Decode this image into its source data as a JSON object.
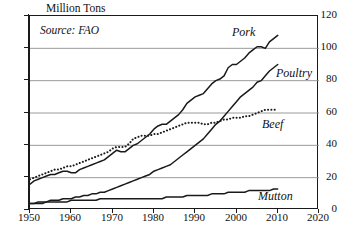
{
  "chart_data": {
    "type": "line",
    "title": "",
    "xlabel": "",
    "ylabel": "Million Tons",
    "ylabel_text": "Million Tons",
    "source_note": "Source: FAO",
    "xlim": [
      1950,
      2020
    ],
    "ylim": [
      0,
      120
    ],
    "xticks": [
      1950,
      1960,
      1970,
      1980,
      1990,
      2000,
      2010,
      2020
    ],
    "yticks": [
      0,
      20,
      40,
      60,
      80,
      100,
      120
    ],
    "grid": "horizontal",
    "legend_position": "inline-right-of-series",
    "x": [
      1950,
      1951,
      1952,
      1953,
      1954,
      1955,
      1956,
      1957,
      1958,
      1959,
      1960,
      1961,
      1962,
      1963,
      1964,
      1965,
      1966,
      1967,
      1968,
      1969,
      1970,
      1971,
      1972,
      1973,
      1974,
      1975,
      1976,
      1977,
      1978,
      1979,
      1980,
      1981,
      1982,
      1983,
      1984,
      1985,
      1986,
      1987,
      1988,
      1989,
      1990,
      1991,
      1992,
      1993,
      1994,
      1995,
      1996,
      1997,
      1998,
      1999,
      2000,
      2001,
      2002,
      2003,
      2004,
      2005,
      2006,
      2007,
      2008,
      2009,
      2010
    ],
    "series": [
      {
        "name": "Pork",
        "style": "solid",
        "label": "Pork",
        "end_value": 108,
        "values": [
          16,
          18,
          19,
          20,
          21,
          22,
          22,
          23,
          24,
          24,
          23,
          23,
          25,
          26,
          27,
          28,
          29,
          30,
          31,
          33,
          35,
          37,
          36,
          36,
          38,
          40,
          41,
          43,
          45,
          47,
          50,
          52,
          53,
          53,
          55,
          57,
          59,
          62,
          66,
          68,
          70,
          71,
          72,
          75,
          78,
          80,
          81,
          83,
          88,
          90,
          90,
          92,
          94,
          97,
          99,
          101,
          101,
          100,
          104,
          106,
          108
        ]
      },
      {
        "name": "Poultry",
        "style": "solid",
        "label": "Poultry",
        "end_value": 90,
        "values": [
          4,
          4,
          5,
          5,
          5,
          6,
          6,
          6,
          7,
          7,
          7,
          8,
          8,
          9,
          9,
          10,
          10,
          11,
          11,
          12,
          13,
          14,
          15,
          16,
          17,
          18,
          19,
          20,
          21,
          22,
          24,
          25,
          26,
          27,
          28,
          30,
          32,
          34,
          36,
          38,
          40,
          42,
          44,
          47,
          50,
          53,
          55,
          58,
          61,
          64,
          67,
          70,
          72,
          74,
          76,
          79,
          80,
          83,
          86,
          88,
          90
        ]
      },
      {
        "name": "Beef",
        "style": "dotted",
        "label": "Beef",
        "end_value": 62,
        "values": [
          19,
          20,
          21,
          22,
          23,
          24,
          25,
          25,
          26,
          27,
          27,
          28,
          29,
          30,
          31,
          32,
          33,
          34,
          35,
          36,
          38,
          39,
          39,
          39,
          41,
          44,
          45,
          46,
          46,
          46,
          47,
          47,
          48,
          49,
          50,
          51,
          52,
          53,
          54,
          54,
          54,
          54,
          53,
          53,
          54,
          54,
          55,
          56,
          56,
          57,
          57,
          57,
          58,
          58,
          59,
          60,
          61,
          62,
          62,
          62,
          62
        ]
      },
      {
        "name": "Mutton",
        "style": "solid",
        "label": "Mutton",
        "end_value": 13,
        "values": [
          4,
          4,
          4,
          4,
          5,
          5,
          5,
          5,
          5,
          5,
          6,
          6,
          6,
          6,
          6,
          6,
          6,
          7,
          7,
          7,
          7,
          7,
          7,
          7,
          7,
          7,
          7,
          7,
          7,
          7,
          7,
          7,
          7,
          8,
          8,
          8,
          8,
          8,
          9,
          9,
          9,
          9,
          9,
          9,
          10,
          10,
          10,
          10,
          11,
          11,
          11,
          11,
          11,
          12,
          12,
          12,
          12,
          12,
          12,
          13,
          13
        ]
      }
    ]
  },
  "colors": {
    "axis": "#1a1a1a",
    "grid": "#8f8f8f",
    "line": "#1a1a1a",
    "background": "#ffffff"
  }
}
